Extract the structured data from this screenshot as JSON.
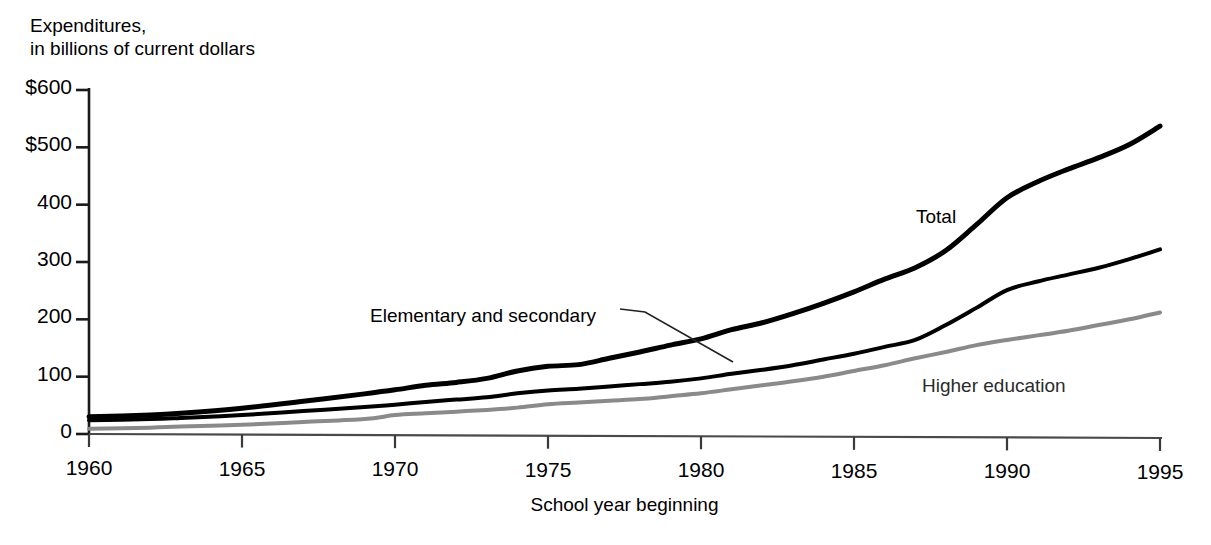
{
  "chart_data": {
    "type": "line",
    "title": "",
    "ylabel": "Expenditures, in billions of current dollars",
    "ylabel_lines": [
      "Expenditures,",
      "in billions of current dollars"
    ],
    "xlabel": "School year beginning",
    "xlim": [
      1960,
      1995
    ],
    "ylim": [
      0,
      600
    ],
    "grid": false,
    "legend_position": "inline-annotations",
    "ytick_labels": [
      "$600",
      "$500",
      "400",
      "300",
      "200",
      "100",
      "0"
    ],
    "ytick_values": [
      600,
      500,
      400,
      300,
      200,
      100,
      0
    ],
    "xtick_labels": [
      "1960",
      "1965",
      "1970",
      "1975",
      "1980",
      "1985",
      "1990",
      "1995"
    ],
    "xtick_values": [
      1960,
      1965,
      1970,
      1975,
      1980,
      1985,
      1990,
      1995
    ],
    "x": [
      1960,
      1962,
      1963,
      1965,
      1967,
      1969,
      1970,
      1971,
      1972,
      1973,
      1974,
      1975,
      1976,
      1977,
      1978,
      1979,
      1980,
      1981,
      1982,
      1983,
      1984,
      1985,
      1986,
      1987,
      1988,
      1989,
      1990,
      1991,
      1992,
      1993,
      1994,
      1995
    ],
    "series": [
      {
        "name": "Total",
        "color": "#000000",
        "width": 5,
        "label": "Total",
        "values": [
          30,
          33,
          36,
          45,
          57,
          70,
          77,
          85,
          90,
          97,
          110,
          118,
          121,
          132,
          143,
          155,
          166,
          182,
          194,
          210,
          228,
          248,
          270,
          290,
          320,
          365,
          412,
          440,
          462,
          482,
          505,
          537
        ]
      },
      {
        "name": "Elementary and secondary",
        "color": "#000000",
        "width": 4,
        "label": "Elementary and secondary",
        "values": [
          24,
          26,
          28,
          33,
          40,
          47,
          51,
          56,
          60,
          64,
          71,
          76,
          79,
          83,
          87,
          91,
          97,
          105,
          112,
          120,
          130,
          140,
          152,
          164,
          190,
          220,
          251,
          266,
          278,
          290,
          305,
          322
        ]
      },
      {
        "name": "Higher education",
        "color": "#8a8a8a",
        "width": 4,
        "label": "Higher education",
        "values": [
          9,
          11,
          13,
          16,
          21,
          26,
          33,
          36,
          39,
          42,
          46,
          52,
          55,
          58,
          61,
          66,
          71,
          78,
          85,
          92,
          100,
          110,
          120,
          132,
          143,
          155,
          164,
          172,
          180,
          190,
          200,
          212
        ]
      }
    ],
    "annotations": [
      {
        "text": "Total",
        "series": "Total",
        "x_px": 916,
        "y_px": 206
      },
      {
        "text": "Elementary and secondary",
        "series": "Elementary and secondary",
        "x_px": 370,
        "y_px": 305,
        "leader": true
      },
      {
        "text": "Higher education",
        "series": "Higher education",
        "x_px": 922,
        "y_px": 375
      }
    ]
  }
}
